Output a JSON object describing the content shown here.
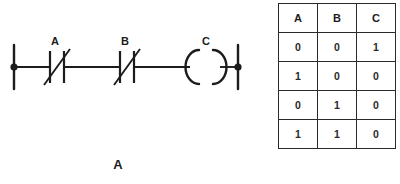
{
  "figure": {
    "panel_a": {
      "caption": "A",
      "type": "ladder-logic-diagram",
      "elements": [
        {
          "id": "left-rail",
          "kind": "power-rail",
          "side": "left"
        },
        {
          "id": "contact-a",
          "kind": "normally-closed-contact",
          "label": "A"
        },
        {
          "id": "contact-b",
          "kind": "normally-closed-contact",
          "label": "B"
        },
        {
          "id": "coil-c",
          "kind": "output-coil",
          "label": "C"
        },
        {
          "id": "right-rail",
          "kind": "power-rail",
          "side": "right"
        }
      ],
      "labels": {
        "contact_a": "A",
        "contact_b": "B",
        "coil_c": "C"
      },
      "colors": {
        "line": "#1c1c1c",
        "background": "#ffffff"
      }
    },
    "panel_b": {
      "caption": "B",
      "type": "truth-table",
      "table": {
        "headers": [
          "A",
          "B",
          "C"
        ],
        "rows": [
          [
            "0",
            "0",
            "1"
          ],
          [
            "1",
            "0",
            "0"
          ],
          [
            "0",
            "1",
            "0"
          ],
          [
            "1",
            "1",
            "0"
          ]
        ]
      },
      "colors": {
        "border": "#2b2b2b",
        "text": "#1c1c1c",
        "background": "#ffffff"
      }
    }
  }
}
